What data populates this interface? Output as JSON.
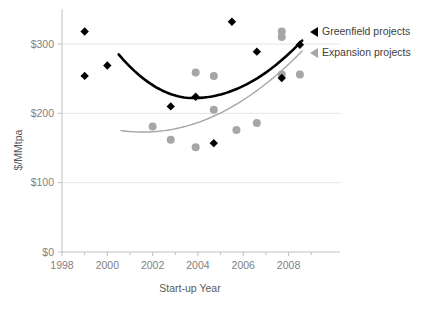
{
  "chart_data": {
    "type": "scatter",
    "title": "",
    "xlabel": "Start-up Year",
    "ylabel": "$/MMtpa",
    "xlim": [
      1998,
      2009.3
    ],
    "ylim": [
      0,
      350
    ],
    "grid": true,
    "legend_position": "right",
    "x_ticks": [
      "1998",
      "2000",
      "2002",
      "2004",
      "2006",
      "2008"
    ],
    "x_tick_values": [
      1998,
      2000,
      2002,
      2004,
      2006,
      2008
    ],
    "y_ticks": [
      "$0",
      "$100",
      "$200",
      "$300"
    ],
    "y_tick_values": [
      0,
      100,
      200,
      300
    ],
    "series": [
      {
        "name": "Greenfield projects",
        "marker": "diamond",
        "color": "#000000",
        "points": [
          {
            "x": 1999.0,
            "y": 318
          },
          {
            "x": 1999.0,
            "y": 254
          },
          {
            "x": 2000.0,
            "y": 269
          },
          {
            "x": 2002.8,
            "y": 210
          },
          {
            "x": 2003.9,
            "y": 224
          },
          {
            "x": 2004.7,
            "y": 157
          },
          {
            "x": 2005.5,
            "y": 332
          },
          {
            "x": 2006.6,
            "y": 289
          },
          {
            "x": 2007.7,
            "y": 251
          },
          {
            "x": 2008.5,
            "y": 299
          }
        ],
        "trend": {
          "type": "polynomial-2",
          "x_start": 2000.5,
          "x_end": 2008.6,
          "y_start": 285,
          "y_min": 222,
          "y_min_x": 2003.8,
          "y_end": 305
        }
      },
      {
        "name": "Expansion projects",
        "marker": "circle",
        "color": "#a6a6a6",
        "points": [
          {
            "x": 2002.0,
            "y": 181
          },
          {
            "x": 2002.8,
            "y": 162
          },
          {
            "x": 2003.9,
            "y": 259
          },
          {
            "x": 2003.9,
            "y": 151
          },
          {
            "x": 2004.7,
            "y": 254
          },
          {
            "x": 2004.7,
            "y": 205
          },
          {
            "x": 2005.7,
            "y": 176
          },
          {
            "x": 2006.6,
            "y": 186
          },
          {
            "x": 2007.7,
            "y": 318
          },
          {
            "x": 2007.7,
            "y": 310
          },
          {
            "x": 2007.7,
            "y": 256
          },
          {
            "x": 2008.5,
            "y": 256
          }
        ],
        "trend": {
          "type": "polynomial-2",
          "x_start": 2000.6,
          "x_end": 2008.6,
          "y_start": 175,
          "y_min": 173,
          "y_min_x": 2001.6,
          "y_end": 290
        }
      }
    ],
    "legend": [
      {
        "label": "Greenfield projects",
        "marker": "triangle-left",
        "color": "#000000"
      },
      {
        "label": "Expansion projects",
        "marker": "triangle-left",
        "color": "#a6a6a6"
      }
    ]
  }
}
